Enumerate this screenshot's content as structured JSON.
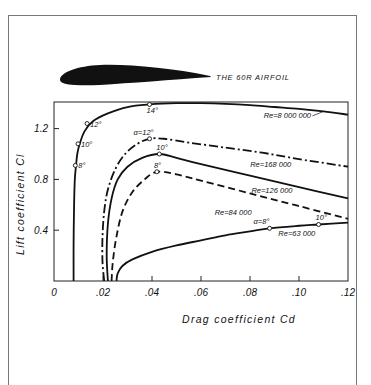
{
  "airfoil": {
    "label": "THE 60R AIRFOIL"
  },
  "chart_data": {
    "type": "line",
    "title": "THE 60R AIRFOIL",
    "xlabel": "Drag coefficient  Cd",
    "ylabel": "Lift coefficient  Cl",
    "xlim": [
      0,
      0.12
    ],
    "ylim": [
      0,
      1.41
    ],
    "x_ticks": [
      0,
      0.02,
      0.04,
      0.06,
      0.08,
      0.1,
      0.12
    ],
    "x_tick_labels": [
      "0",
      ".02",
      ".04",
      ".06",
      ".08",
      ".10",
      ".12"
    ],
    "y_ticks": [
      0.4,
      0.8,
      1.2
    ],
    "y_tick_labels": [
      "0.4",
      "0.8",
      "1.2"
    ],
    "grid": false,
    "legend": "inline labels",
    "series": [
      {
        "name": "Re=8 000 000",
        "style": "solid",
        "points": [
          [
            0.008,
            0.0
          ],
          [
            0.008,
            0.3
          ],
          [
            0.0082,
            0.6
          ],
          [
            0.0085,
            0.8
          ],
          [
            0.009,
            0.91
          ],
          [
            0.0095,
            1.0
          ],
          [
            0.0105,
            1.08
          ],
          [
            0.0125,
            1.18
          ],
          [
            0.016,
            1.26
          ],
          [
            0.022,
            1.32
          ],
          [
            0.03,
            1.37
          ],
          [
            0.039,
            1.39
          ],
          [
            0.05,
            1.4
          ],
          [
            0.06,
            1.4
          ],
          [
            0.07,
            1.395
          ],
          [
            0.08,
            1.385
          ],
          [
            0.09,
            1.37
          ],
          [
            0.1,
            1.355
          ],
          [
            0.11,
            1.335
          ],
          [
            0.12,
            1.31
          ]
        ],
        "markers": [
          {
            "label": "8°",
            "cd": 0.0087,
            "cl": 0.91
          },
          {
            "label": "10°",
            "cd": 0.0098,
            "cl": 1.08
          },
          {
            "label": "12°",
            "cd": 0.0135,
            "cl": 1.24
          },
          {
            "label": "14°",
            "cd": 0.039,
            "cl": 1.39
          }
        ]
      },
      {
        "name": "Re=168000",
        "style": "dash-dot",
        "points": [
          [
            0.0205,
            0.0
          ],
          [
            0.0198,
            0.15
          ],
          [
            0.0198,
            0.35
          ],
          [
            0.0205,
            0.55
          ],
          [
            0.022,
            0.72
          ],
          [
            0.025,
            0.88
          ],
          [
            0.029,
            1.0
          ],
          [
            0.034,
            1.08
          ],
          [
            0.039,
            1.12
          ],
          [
            0.045,
            1.12
          ],
          [
            0.055,
            1.09
          ],
          [
            0.07,
            1.05
          ],
          [
            0.085,
            1.01
          ],
          [
            0.1,
            0.96
          ],
          [
            0.12,
            0.9
          ]
        ],
        "markers": [
          {
            "label": "α=12°",
            "cd": 0.039,
            "cl": 1.12
          }
        ]
      },
      {
        "name": "Re=126000",
        "style": "solid",
        "points": [
          [
            0.022,
            0.0
          ],
          [
            0.0215,
            0.2
          ],
          [
            0.022,
            0.45
          ],
          [
            0.0235,
            0.65
          ],
          [
            0.026,
            0.8
          ],
          [
            0.03,
            0.9
          ],
          [
            0.036,
            0.97
          ],
          [
            0.043,
            1.0
          ],
          [
            0.05,
            0.97
          ],
          [
            0.06,
            0.92
          ],
          [
            0.08,
            0.83
          ],
          [
            0.1,
            0.74
          ],
          [
            0.12,
            0.65
          ]
        ],
        "markers": [
          {
            "label": "10°",
            "cd": 0.043,
            "cl": 1.0
          }
        ]
      },
      {
        "name": "Re=84000",
        "style": "dashed",
        "points": [
          [
            0.0235,
            0.0
          ],
          [
            0.024,
            0.15
          ],
          [
            0.0255,
            0.35
          ],
          [
            0.028,
            0.55
          ],
          [
            0.032,
            0.7
          ],
          [
            0.037,
            0.8
          ],
          [
            0.042,
            0.86
          ],
          [
            0.05,
            0.84
          ],
          [
            0.06,
            0.79
          ],
          [
            0.08,
            0.69
          ],
          [
            0.1,
            0.59
          ],
          [
            0.12,
            0.49
          ]
        ],
        "markers": [
          {
            "label": "8°",
            "cd": 0.042,
            "cl": 0.86
          }
        ]
      },
      {
        "name": "Re=63000",
        "style": "solid",
        "points": [
          [
            0.0255,
            0.0
          ],
          [
            0.026,
            0.06
          ],
          [
            0.028,
            0.12
          ],
          [
            0.032,
            0.17
          ],
          [
            0.04,
            0.23
          ],
          [
            0.05,
            0.28
          ],
          [
            0.06,
            0.32
          ],
          [
            0.07,
            0.36
          ],
          [
            0.08,
            0.39
          ],
          [
            0.088,
            0.415
          ],
          [
            0.1,
            0.435
          ],
          [
            0.108,
            0.445
          ],
          [
            0.12,
            0.46
          ]
        ],
        "markers": [
          {
            "label": "α=8°",
            "cd": 0.088,
            "cl": 0.415
          },
          {
            "label": "10°",
            "cd": 0.108,
            "cl": 0.445
          }
        ]
      }
    ],
    "annotations": [
      {
        "text": "Re=8 000 000",
        "cd": 0.097,
        "cl": 1.31
      },
      {
        "text": "Re=168 000",
        "cd": 0.0915,
        "cl": 0.92
      },
      {
        "text": "Re=126 000",
        "cd": 0.092,
        "cl": 0.72
      },
      {
        "text": "Re=84 000",
        "cd": 0.077,
        "cl": 0.545
      },
      {
        "text": "Re=63 000",
        "cd": 0.103,
        "cl": 0.375
      }
    ]
  }
}
